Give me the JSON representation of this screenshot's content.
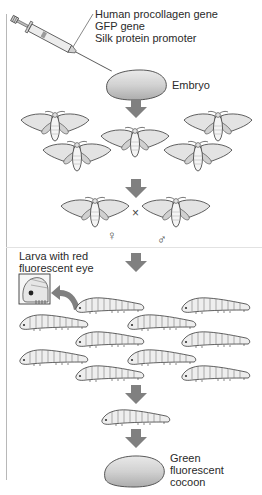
{
  "diagram": {
    "title": "",
    "injection": {
      "icon": "syringe-icon",
      "labels": [
        "Human procollagen gene",
        "GFP gene",
        "Silk protein promoter"
      ]
    },
    "embryo": {
      "label": "Embryo"
    },
    "cross": {
      "operator": "×",
      "female_symbol": "♀",
      "male_symbol": "♂"
    },
    "larva_inset": {
      "label_lines": [
        "Larva with red",
        "fluorescent eye"
      ]
    },
    "cocoon": {
      "label_lines": [
        "Green",
        "fluorescent",
        "cocoon"
      ]
    },
    "steps": [
      "Inject genes into embryo",
      "Transgenic moths",
      "Female × male cross",
      "Larvae screened for red fluorescent eye",
      "Selected larva",
      "Green fluorescent cocoon"
    ],
    "colors": {
      "arrow": "#808080",
      "outline": "#3a3a3a",
      "fill_light": "#e6e6e6",
      "fill_mid": "#cfcfcf",
      "text": "#2a2a2a"
    }
  }
}
